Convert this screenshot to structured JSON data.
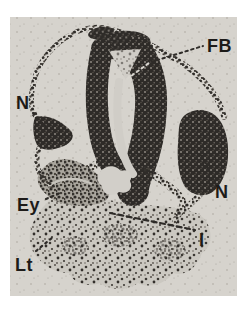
{
  "figure": {
    "name": "embryo cross-section micrograph",
    "photo_background": "#d6d3cd",
    "page_background": "#ffffff",
    "tissue_dark": "#2e2b28",
    "label_color": "#1d1b19",
    "labels": [
      {
        "id": "FB",
        "text": "FB",
        "position": "top-right"
      },
      {
        "id": "N-left",
        "text": "N",
        "position": "upper-left"
      },
      {
        "id": "N-right",
        "text": "N",
        "position": "mid-right"
      },
      {
        "id": "Ey",
        "text": "Ey",
        "position": "lower-left"
      },
      {
        "id": "I",
        "text": "I",
        "position": "lower-right"
      },
      {
        "id": "Lt",
        "text": "Lt",
        "position": "bottom-left"
      }
    ]
  }
}
